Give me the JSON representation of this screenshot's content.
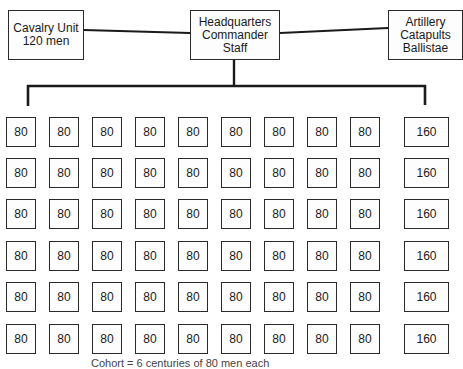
{
  "diagram": {
    "type": "org-chart",
    "top_nodes": {
      "cavalry": {
        "lines": [
          "Cavalry Unit",
          "120 men"
        ]
      },
      "headquarters": {
        "lines": [
          "Headquarters",
          "Commander",
          "Staff"
        ]
      },
      "artillery": {
        "lines": [
          "Artillery",
          "Catapults",
          "Ballistae"
        ]
      }
    },
    "grid": {
      "rows": 6,
      "columns": 10,
      "row_values": [
        [
          "80",
          "80",
          "80",
          "80",
          "80",
          "80",
          "80",
          "80",
          "80",
          "160"
        ],
        [
          "80",
          "80",
          "80",
          "80",
          "80",
          "80",
          "80",
          "80",
          "80",
          "160"
        ],
        [
          "80",
          "80",
          "80",
          "80",
          "80",
          "80",
          "80",
          "80",
          "80",
          "160"
        ],
        [
          "80",
          "80",
          "80",
          "80",
          "80",
          "80",
          "80",
          "80",
          "80",
          "160"
        ],
        [
          "80",
          "80",
          "80",
          "80",
          "80",
          "80",
          "80",
          "80",
          "80",
          "160"
        ],
        [
          "80",
          "80",
          "80",
          "80",
          "80",
          "80",
          "80",
          "80",
          "80",
          "160"
        ]
      ]
    },
    "caption": "Cohort = 6 centuries of 80 men each"
  },
  "colors": {
    "line": "#1a1a1a",
    "box_border": "#2a2a2a",
    "background": "#ffffff"
  }
}
